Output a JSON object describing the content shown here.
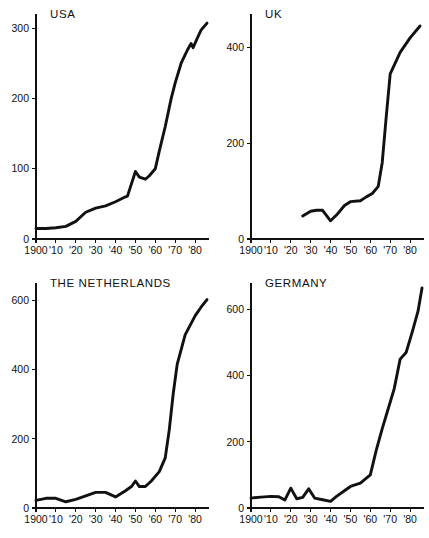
{
  "figure": {
    "title": "",
    "panel_count": 4,
    "background_color": "#ffffff",
    "line_color": "#111111",
    "axis_color": "#111111"
  },
  "chart_data": [
    {
      "type": "line",
      "title": "USA",
      "xlabel": "",
      "ylabel": "",
      "xlim": [
        1900,
        1987
      ],
      "ylim": [
        0,
        320
      ],
      "grid": false,
      "legend": "none",
      "xticks": [
        1900,
        1910,
        1920,
        1930,
        1940,
        1950,
        1960,
        1970,
        1980
      ],
      "xticklabels": [
        "1900",
        "'10",
        "'20",
        "'30",
        "'40",
        "'50",
        "'60",
        "'70",
        "'80"
      ],
      "yticks": [
        0,
        100,
        200,
        300
      ],
      "yticklabels": [
        "0",
        "100",
        "200",
        "300"
      ],
      "x": [
        1900,
        1905,
        1910,
        1915,
        1920,
        1925,
        1930,
        1935,
        1940,
        1945,
        1946,
        1950,
        1952,
        1955,
        1957,
        1960,
        1962,
        1965,
        1968,
        1970,
        1973,
        1976,
        1978,
        1979,
        1981,
        1983,
        1986
      ],
      "values": [
        15,
        15,
        16,
        18,
        25,
        38,
        44,
        47,
        53,
        60,
        61,
        96,
        88,
        85,
        90,
        100,
        125,
        160,
        200,
        222,
        250,
        268,
        278,
        272,
        285,
        297,
        307
      ]
    },
    {
      "type": "line",
      "title": "UK",
      "xlabel": "",
      "ylabel": "",
      "xlim": [
        1900,
        1987
      ],
      "ylim": [
        0,
        470
      ],
      "grid": false,
      "legend": "none",
      "xticks": [
        1900,
        1910,
        1920,
        1930,
        1940,
        1950,
        1960,
        1970,
        1980
      ],
      "xticklabels": [
        "1900",
        "'10",
        "'20",
        "'30",
        "'40",
        "'50",
        "'60",
        "'70",
        "'80"
      ],
      "yticks": [
        0,
        200,
        400
      ],
      "yticklabels": [
        "0",
        "200",
        "400"
      ],
      "x": [
        1926,
        1930,
        1933,
        1936,
        1940,
        1943,
        1947,
        1950,
        1955,
        1958,
        1961,
        1964,
        1966,
        1968,
        1970,
        1975,
        1980,
        1985
      ],
      "values": [
        48,
        58,
        60,
        60,
        38,
        50,
        70,
        78,
        80,
        88,
        95,
        110,
        160,
        255,
        345,
        390,
        420,
        445
      ]
    },
    {
      "type": "line",
      "title": "THE NETHERLANDS",
      "xlabel": "",
      "ylabel": "",
      "xlim": [
        1900,
        1987
      ],
      "ylim": [
        0,
        650
      ],
      "grid": false,
      "legend": "none",
      "xticks": [
        1900,
        1910,
        1920,
        1930,
        1940,
        1950,
        1960,
        1970,
        1980
      ],
      "xticklabels": [
        "1900",
        "'10",
        "'20",
        "'30",
        "'40",
        "'50",
        "'60",
        "'70",
        "'80"
      ],
      "yticks": [
        0,
        200,
        400,
        600
      ],
      "yticklabels": [
        "0",
        "200",
        "400",
        "600"
      ],
      "x": [
        1900,
        1905,
        1910,
        1915,
        1920,
        1925,
        1930,
        1935,
        1940,
        1945,
        1948,
        1950,
        1952,
        1955,
        1958,
        1962,
        1965,
        1967,
        1969,
        1971,
        1975,
        1980,
        1983,
        1986
      ],
      "values": [
        22,
        28,
        28,
        18,
        25,
        35,
        45,
        45,
        32,
        50,
        62,
        78,
        62,
        62,
        78,
        105,
        145,
        225,
        330,
        415,
        500,
        555,
        580,
        602
      ]
    },
    {
      "type": "line",
      "title": "GERMANY",
      "xlabel": "",
      "ylabel": "",
      "xlim": [
        1900,
        1987
      ],
      "ylim": [
        0,
        680
      ],
      "grid": false,
      "legend": "none",
      "xticks": [
        1900,
        1910,
        1920,
        1930,
        1940,
        1950,
        1960,
        1970,
        1980
      ],
      "xticklabels": [
        "1900",
        "'10",
        "'20",
        "'30",
        "'40",
        "'50",
        "'60",
        "'70",
        "'80"
      ],
      "yticks": [
        0,
        200,
        400,
        600
      ],
      "yticklabels": [
        "0",
        "200",
        "400",
        "600"
      ],
      "x": [
        1900,
        1905,
        1910,
        1914,
        1917,
        1920,
        1923,
        1926,
        1929,
        1932,
        1936,
        1940,
        1943,
        1947,
        1950,
        1955,
        1960,
        1963,
        1966,
        1969,
        1972,
        1975,
        1978,
        1981,
        1984,
        1986
      ],
      "values": [
        30,
        33,
        35,
        34,
        24,
        60,
        28,
        32,
        58,
        30,
        25,
        20,
        35,
        52,
        65,
        75,
        100,
        175,
        240,
        300,
        360,
        450,
        470,
        530,
        595,
        665
      ]
    }
  ]
}
